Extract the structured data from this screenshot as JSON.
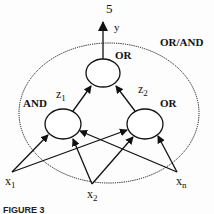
{
  "diagram": {
    "output": {
      "number_label": "5",
      "variable": "y"
    },
    "group_label": "OR/AND",
    "nodes": {
      "top": {
        "label": "OR"
      },
      "left": {
        "label": "AND",
        "output": {
          "base": "z",
          "sub": "1"
        }
      },
      "right": {
        "label": "OR",
        "output": {
          "base": "z",
          "sub": "2"
        }
      }
    },
    "inputs": [
      {
        "base": "x",
        "sub": "1"
      },
      {
        "base": "x",
        "sub": "2"
      },
      {
        "base": "x",
        "sub": "n"
      }
    ],
    "caption": "FIGURE 3"
  },
  "colors": {
    "stroke": "#111111",
    "background": "#fdfdfd"
  }
}
